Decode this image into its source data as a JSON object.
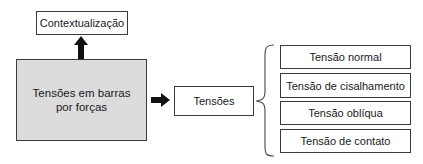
{
  "diagram": {
    "top_box": {
      "label": "Contextualização"
    },
    "main_box": {
      "label": "Tensões em barras\npor forças",
      "line1": "Tensões em barras",
      "line2": "por forças",
      "fill": "#dcdcdc"
    },
    "middle_box": {
      "label": "Tensões"
    },
    "types": [
      {
        "label": "Tensão normal"
      },
      {
        "label": "Tensão de cisalhamento"
      },
      {
        "label": "Tensão oblíqua"
      },
      {
        "label": "Tensão de contato"
      }
    ],
    "connectors": [
      {
        "from": "main_box",
        "to": "top_box",
        "type": "arrow-up"
      },
      {
        "from": "main_box",
        "to": "middle_box",
        "type": "arrow-right"
      },
      {
        "from": "middle_box",
        "to": "types",
        "type": "curly-brace"
      }
    ]
  }
}
